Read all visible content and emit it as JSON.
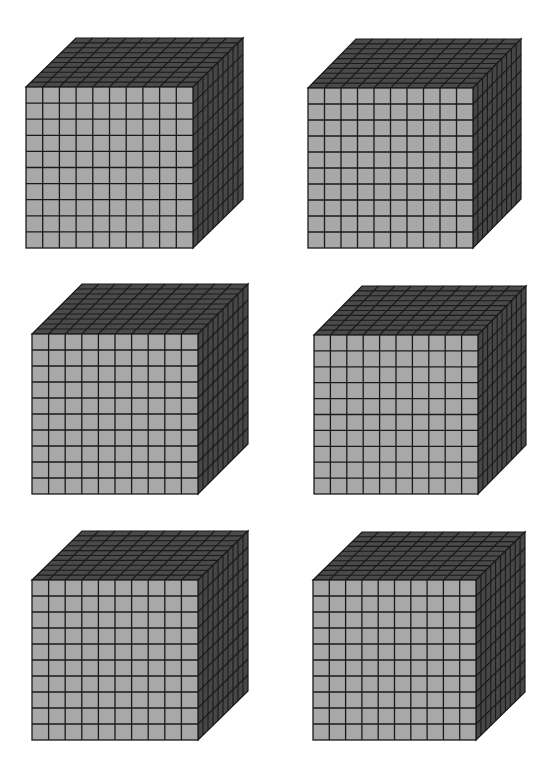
{
  "worksheet": {
    "description": "Six base-ten thousand cubes (10 x 10 x 10)",
    "grid_divisions": 10,
    "colors": {
      "front_face": "#a8a8a8",
      "top_face": "#4a4a4a",
      "side_face": "#474747",
      "grid_line": "#1a1a1a",
      "background": "#ffffff"
    },
    "cubes": [
      {
        "id": 1,
        "front": {
          "x": 26,
          "y": 87,
          "w": 167,
          "h": 161
        },
        "depth": {
          "dx": 50,
          "dy": -49
        }
      },
      {
        "id": 2,
        "front": {
          "x": 308,
          "y": 88,
          "w": 165,
          "h": 160
        },
        "depth": {
          "dx": 48,
          "dy": -49
        }
      },
      {
        "id": 3,
        "front": {
          "x": 32,
          "y": 334,
          "w": 166,
          "h": 160
        },
        "depth": {
          "dx": 50,
          "dy": -50
        }
      },
      {
        "id": 4,
        "front": {
          "x": 314,
          "y": 335,
          "w": 164,
          "h": 159
        },
        "depth": {
          "dx": 48,
          "dy": -49
        }
      },
      {
        "id": 5,
        "front": {
          "x": 32,
          "y": 580,
          "w": 166,
          "h": 160
        },
        "depth": {
          "dx": 50,
          "dy": -49
        }
      },
      {
        "id": 6,
        "front": {
          "x": 313,
          "y": 580,
          "w": 163,
          "h": 160
        },
        "depth": {
          "dx": 49,
          "dy": -48
        }
      }
    ]
  }
}
